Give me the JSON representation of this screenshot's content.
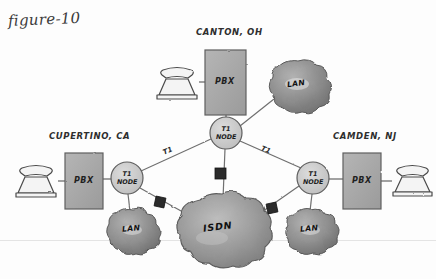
{
  "figure": {
    "title": "figure-10",
    "baseline_rule": true,
    "canvas": {
      "width": 436,
      "height": 279,
      "background": "#fdfdfd"
    }
  },
  "palette": {
    "ink": "#3a3a3a",
    "pbx_fill": "#a8a8a8",
    "node_fill": "#c9c9c9",
    "lan_cloud_fill": "#8c8c8c",
    "isdn_cloud_fill": "#9a9a9a",
    "connector_fill": "#2b2b2b",
    "phone_fill": "#f2f2f2",
    "line": "#6f6f6f"
  },
  "sites": [
    {
      "id": "canton",
      "label": "CANTON, OH",
      "label_pos": {
        "x": 196,
        "y": 33
      },
      "phone": {
        "name": "phone-icon-canton",
        "x": 155,
        "y": 65,
        "w": 44,
        "h": 34
      },
      "pbx": {
        "label": "PBX",
        "x": 205,
        "y": 50,
        "w": 41,
        "h": 65
      },
      "node": {
        "label_line1": "T1",
        "label_line2": "NODE",
        "cx": 226,
        "cy": 133,
        "r": 16
      },
      "lan": {
        "label": "LAN",
        "cx": 296,
        "cy": 85,
        "rx": 28,
        "ry": 26
      }
    },
    {
      "id": "cupertino",
      "label": "CUPERTINO, CA",
      "label_pos": {
        "x": 49,
        "y": 137
      },
      "phone": {
        "name": "phone-icon-cupertino",
        "x": 14,
        "y": 163,
        "w": 44,
        "h": 34
      },
      "pbx": {
        "label": "PBX",
        "x": 65,
        "y": 153,
        "w": 38,
        "h": 56
      },
      "node": {
        "label_line1": "T1",
        "label_line2": "NODE",
        "cx": 127,
        "cy": 178,
        "r": 16
      },
      "lan": {
        "label": "LAN",
        "cx": 131,
        "cy": 229,
        "rx": 24,
        "ry": 22
      }
    },
    {
      "id": "camden",
      "label": "CAMDEN, NJ",
      "label_pos": {
        "x": 333,
        "y": 137
      },
      "phone": {
        "name": "phone-icon-camden",
        "x": 392,
        "y": 163,
        "w": 42,
        "h": 33
      },
      "pbx": {
        "label": "PBX",
        "x": 343,
        "y": 153,
        "w": 38,
        "h": 56
      },
      "node": {
        "label_line1": "T1",
        "label_line2": "NODE",
        "cx": 313,
        "cy": 178,
        "r": 16
      },
      "lan": {
        "label": "LAN",
        "cx": 309,
        "cy": 229,
        "rx": 24,
        "ry": 22
      }
    }
  ],
  "isdn_cloud": {
    "label": "ISDN",
    "cx": 222,
    "cy": 228,
    "rx": 44,
    "ry": 31
  },
  "links": [
    {
      "id": "canton-pbx-to-phone",
      "label": "",
      "from": "phone-canton",
      "to": "pbx-canton"
    },
    {
      "id": "canton-pbx-to-node",
      "label": "",
      "from": "pbx-canton",
      "to": "node-canton"
    },
    {
      "id": "canton-node-to-lan",
      "label": "",
      "from": "node-canton",
      "to": "lan-canton"
    },
    {
      "id": "cupertino-phone-to-pbx",
      "label": "",
      "from": "phone-cupertino",
      "to": "pbx-cupertino"
    },
    {
      "id": "cupertino-pbx-to-node",
      "label": "",
      "from": "pbx-cupertino",
      "to": "node-cupertino"
    },
    {
      "id": "cupertino-node-to-lan",
      "label": "",
      "from": "node-cupertino",
      "to": "lan-cupertino"
    },
    {
      "id": "camden-phone-to-pbx",
      "label": "",
      "from": "phone-camden",
      "to": "pbx-camden"
    },
    {
      "id": "camden-pbx-to-node",
      "label": "",
      "from": "pbx-camden",
      "to": "node-camden"
    },
    {
      "id": "camden-node-to-lan",
      "label": "",
      "from": "node-camden",
      "to": "lan-camden"
    },
    {
      "id": "t1-cupertino-canton",
      "label": "T1",
      "label_pos": {
        "x": 163,
        "y": 152
      },
      "from": "node-cupertino",
      "to": "node-canton"
    },
    {
      "id": "t1-canton-camden",
      "label": "T1",
      "label_pos": {
        "x": 261,
        "y": 151
      },
      "from": "node-canton",
      "to": "node-camden"
    },
    {
      "id": "isdn-canton",
      "label": "",
      "from": "node-canton",
      "to": "isdn"
    },
    {
      "id": "isdn-cupertino",
      "label": "",
      "from": "node-cupertino",
      "to": "isdn"
    },
    {
      "id": "isdn-camden",
      "label": "",
      "from": "node-camden",
      "to": "isdn"
    }
  ],
  "connectors": [
    {
      "id": "csu-canton",
      "x": 220,
      "y": 173,
      "size": 11
    },
    {
      "id": "csu-cupertino",
      "x": 160,
      "y": 202,
      "size": 10
    },
    {
      "id": "csu-camden",
      "x": 272,
      "y": 208,
      "size": 10
    }
  ]
}
